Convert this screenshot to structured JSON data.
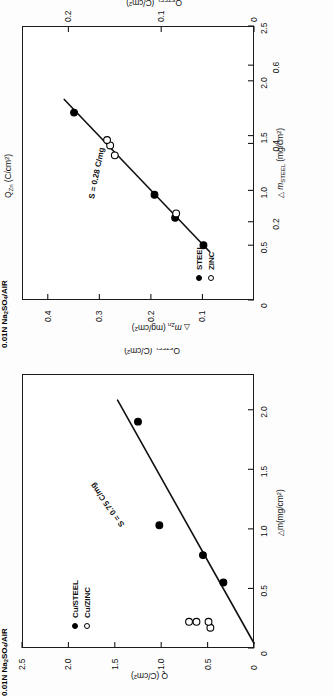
{
  "figure": {
    "orientation": "page-rotated-90-ccw",
    "panel_count": 2,
    "background_color": "#ffffff",
    "ink_color": "#000000"
  },
  "chart_data": [
    {
      "type": "scatter",
      "id": "zinc-steel-mass-loss",
      "title": "",
      "xlabel": "Δ m_STEEL (mg/cm²)",
      "ylabel": "Δ m_Zn (mg/cm²)",
      "xlabel_parts": {
        "delta": "△",
        "main": "m",
        "sub": "STEEL",
        "units": "(mg/cm",
        "sup": "2",
        "close": ")"
      },
      "ylabel_parts": {
        "delta": "△",
        "main": "m",
        "sub": "Zn",
        "units": "(mg/cm",
        "sup": "2",
        "close": ")"
      },
      "secondary_xlabel": "Q_STEEL (C/cm²)",
      "secondary_xlabel_parts": {
        "main": "Q",
        "sub": "STEEL",
        "units": "(C/cm",
        "sup": "2",
        "close": ")"
      },
      "secondary_ylabel": "Q_Zn (C/cm²)",
      "secondary_ylabel_parts": {
        "main": "Q",
        "sub": "Zn",
        "units": "(C/cm",
        "sup": "2",
        "close": ")"
      },
      "xlim": [
        0,
        2.5
      ],
      "ylim": [
        0,
        0.45
      ],
      "xticks": [
        0,
        0.5,
        1.0,
        1.5,
        2.0,
        2.5
      ],
      "xticklabels": [
        "0",
        "0.5",
        "1.0",
        "1.5",
        "2.0",
        "2.5"
      ],
      "yticks": [
        0.1,
        0.2,
        0.3,
        0.4
      ],
      "yticklabels": [
        "0.1",
        "0.2",
        "0.3",
        "0.4"
      ],
      "secondary_xlim": [
        0,
        0.7
      ],
      "secondary_xticks": [
        0.2,
        0.4,
        0.6
      ],
      "secondary_xticklabels": [
        "0.2",
        "0.4",
        "0.6"
      ],
      "secondary_ylim": [
        0,
        0.25
      ],
      "secondary_yticks": [
        0,
        0.1,
        0.2
      ],
      "secondary_yticklabels": [
        "0",
        "0.1",
        "0.2"
      ],
      "grid": false,
      "legend_position": "lower-left",
      "legend_condition": "0.01N Na2SO4/AIR",
      "legend_condition_parts": {
        "prefix": "0.01N Na",
        "sub1": "2",
        "mid": "SO",
        "sub2": "4",
        "suffix": "/AIR"
      },
      "annotation": "S = 0.28 C/mg",
      "series": [
        {
          "name": "STEEL",
          "marker": "filled-circle",
          "points": [
            {
              "x": 0.5,
              "y": 0.098
            },
            {
              "x": 0.75,
              "y": 0.153
            },
            {
              "x": 0.96,
              "y": 0.193
            },
            {
              "x": 1.71,
              "y": 0.349
            }
          ]
        },
        {
          "name": "ZINC",
          "marker": "open-circle",
          "points": [
            {
              "x": 0.79,
              "y": 0.151
            },
            {
              "x": 1.32,
              "y": 0.27
            },
            {
              "x": 1.41,
              "y": 0.279
            },
            {
              "x": 1.46,
              "y": 0.285
            }
          ]
        }
      ],
      "fit_line": {
        "x0": 0.44,
        "y0": 0.086,
        "x1": 1.83,
        "y1": 0.368,
        "slope_label": "S = 0.28 C/mg"
      }
    },
    {
      "type": "scatter",
      "id": "copper-charge-mass-loss",
      "title": "",
      "xlabel": "Δm (mg/cm²)",
      "ylabel": "Q (C/cm²)",
      "xlabel_parts": {
        "delta": "△",
        "main": "m",
        "units": "(mg/cm",
        "sup": "2",
        "close": ")"
      },
      "ylabel_parts": {
        "main": "Q",
        "units": "(C/cm",
        "sup": "2",
        "close": ")"
      },
      "secondary_ylabel": "Q_STEEL (C/cm²)",
      "secondary_ylabel_parts": {
        "main": "Q",
        "sub": "STEEL",
        "units": "(C/cm",
        "sup": "2",
        "close": ")"
      },
      "xlim": [
        0,
        2.3
      ],
      "ylim": [
        0,
        2.5
      ],
      "xticks": [
        0,
        0.5,
        1.0,
        1.5,
        2.0
      ],
      "xticklabels": [
        "0",
        "0.5",
        "1.0",
        "1.5",
        "2.0"
      ],
      "yticks": [
        0,
        0.5,
        1.0,
        1.5,
        2.0,
        2.5
      ],
      "yticklabels": [
        "0",
        "0.5",
        "1.0",
        "1.5",
        "2.0",
        "2.5"
      ],
      "grid": false,
      "legend_position": "upper-left",
      "legend_condition": "0.01N Na2SO4/AIR",
      "legend_condition_parts": {
        "prefix": "0.01N Na",
        "sub1": "2",
        "mid": "SO",
        "sub2": "4",
        "suffix": "/AIR"
      },
      "annotation": "S = 0.75 C/mg",
      "series": [
        {
          "name": "Cu/STEEL",
          "marker": "filled-circle",
          "points": [
            {
              "x": 0.55,
              "y": 0.33
            },
            {
              "x": 0.78,
              "y": 0.55
            },
            {
              "x": 1.03,
              "y": 1.02
            },
            {
              "x": 1.9,
              "y": 1.25
            }
          ]
        },
        {
          "name": "Cu/ZINC",
          "marker": "open-circle",
          "points": [
            {
              "x": 0.17,
              "y": 0.47
            },
            {
              "x": 0.22,
              "y": 0.49
            },
            {
              "x": 0.22,
              "y": 0.62
            },
            {
              "x": 0.22,
              "y": 0.7
            }
          ]
        }
      ],
      "fit_line": {
        "x0": 0.04,
        "y0": 0.0,
        "x1": 2.08,
        "y1": 1.47,
        "slope_label": "S = 0.75 C/mg"
      }
    }
  ]
}
